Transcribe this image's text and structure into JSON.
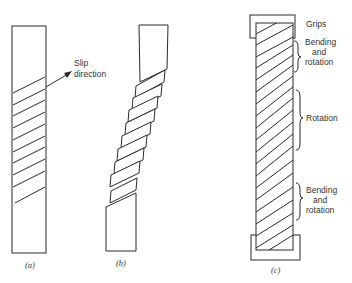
{
  "figure": {
    "panels": [
      {
        "id": "a",
        "caption": "(a)",
        "description": "Single crystal bar with parallel slip planes"
      },
      {
        "id": "b",
        "caption": "(b)",
        "description": "Slipped crystal showing offset blocks"
      },
      {
        "id": "c",
        "caption": "(c)",
        "description": "Crystal constrained by grips"
      }
    ],
    "labels": {
      "slip_direction": [
        "Slip",
        "direction"
      ],
      "grips": "Grips",
      "bending_top": [
        "Bending",
        "and",
        "rotation"
      ],
      "rotation": "Rotation",
      "bending_bottom": [
        "Bending",
        "and",
        "rotation"
      ]
    },
    "colors": {
      "stroke": "#2a2a2a",
      "text": "#333333",
      "background": "#ffffff"
    }
  }
}
